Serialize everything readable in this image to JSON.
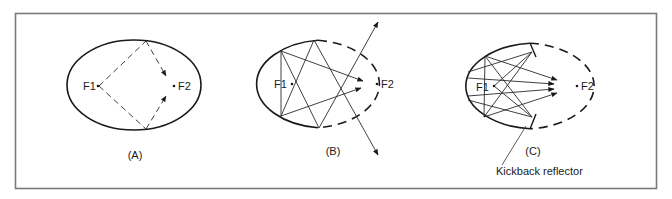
{
  "figure": {
    "colors": {
      "frame": "#7a7a7a",
      "ink": "#1a1a1a",
      "background": "#ffffff"
    },
    "panels": [
      {
        "id": "A",
        "caption": "(A)",
        "focus1_label": "F1",
        "focus2_label": "F2",
        "description": "Full ellipse; dashed rays from F1 reflect off top and bottom of ellipse to F2"
      },
      {
        "id": "B",
        "caption": "(B)",
        "focus1_label": "F1",
        "focus2_label": "F2",
        "description": "Left half of ellipse solid, right half dashed; rays reflect and some escape the ellipse"
      },
      {
        "id": "C",
        "caption": "(C)",
        "focus1_label": "F1",
        "focus2_label": "F2",
        "description": "Partial reflector with kickback reflector ends directing rays toward F2",
        "annotation": "Kickback reflector"
      }
    ]
  }
}
